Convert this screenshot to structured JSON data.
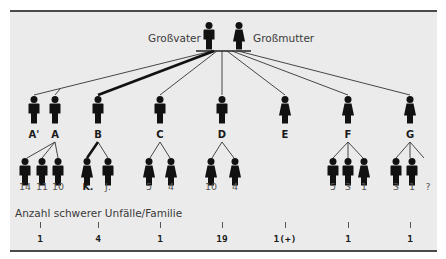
{
  "grandparents": {
    "grandfather_label": "Großvater",
    "grandmother_label": "Großmutter"
  },
  "generation2": [
    {
      "label": "A'",
      "sex": "male"
    },
    {
      "label": "A",
      "sex": "male"
    },
    {
      "label": "B",
      "sex": "male"
    },
    {
      "label": "C",
      "sex": "male"
    },
    {
      "label": "D",
      "sex": "male"
    },
    {
      "label": "E",
      "sex": "female"
    },
    {
      "label": "F",
      "sex": "female"
    },
    {
      "label": "G",
      "sex": "female"
    }
  ],
  "generation3": {
    "A": [
      "14",
      "11",
      "10"
    ],
    "B": [
      "K.",
      "J."
    ],
    "C": [
      "5",
      "4"
    ],
    "D": [
      "10",
      "4"
    ],
    "F": [
      "5",
      "3",
      "1"
    ],
    "G": [
      "3",
      "1",
      "?"
    ]
  },
  "caption": "Anzahl schwerer Unfälle/Familie",
  "family_counts": [
    {
      "family": "A",
      "count": "1"
    },
    {
      "family": "B",
      "count": "4"
    },
    {
      "family": "C",
      "count": "1"
    },
    {
      "family": "D",
      "count": "19"
    },
    {
      "family": "E",
      "count": "1(+)"
    },
    {
      "family": "F",
      "count": "1"
    },
    {
      "family": "G",
      "count": "1"
    }
  ],
  "colors": {
    "background": "#ebebeb",
    "figure": "#111111",
    "rule": "#4a4a4a"
  }
}
